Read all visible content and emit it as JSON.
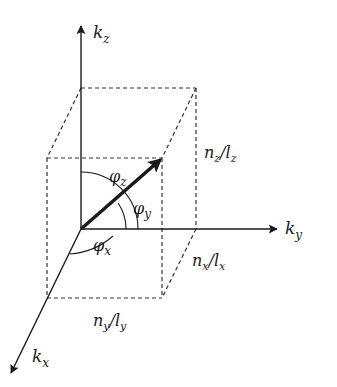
{
  "diagram": {
    "type": "3d-wavevector-box",
    "colors": {
      "ink": "#1a1a1a",
      "dash": "#333333",
      "background": "#ffffff"
    },
    "axes": {
      "kz": {
        "label": "k",
        "sub": "z"
      },
      "ky": {
        "label": "k",
        "sub": "y"
      },
      "kx": {
        "label": "k",
        "sub": "x"
      }
    },
    "angles": {
      "phi_z": {
        "label": "φ",
        "sub": "z"
      },
      "phi_y": {
        "label": "φ",
        "sub": "y"
      },
      "phi_x": {
        "label": "φ",
        "sub": "x"
      }
    },
    "edges": {
      "nz_lz": {
        "n": "n",
        "nsub": "z",
        "l": "l",
        "lsub": "z"
      },
      "nx_lx": {
        "n": "n",
        "nsub": "x",
        "l": "l",
        "lsub": "x"
      },
      "ny_ly": {
        "n": "n",
        "nsub": "y",
        "l": "l",
        "lsub": "y"
      }
    }
  }
}
